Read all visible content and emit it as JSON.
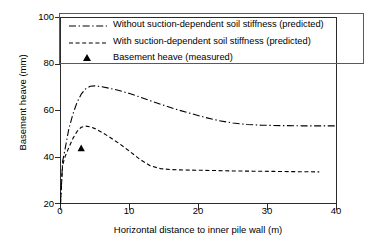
{
  "chart_data": {
    "type": "line",
    "title": "",
    "xlabel": "Horizontal distance to inner pile wall (m)",
    "ylabel": "Basement heave (mm)",
    "xlim": [
      0,
      40
    ],
    "ylim": [
      20,
      100
    ],
    "xticks": [
      0,
      10,
      20,
      30,
      40
    ],
    "yticks": [
      20,
      40,
      60,
      80,
      100
    ],
    "grid": false,
    "legend_position": "top-left",
    "series": [
      {
        "name": "Without suction-dependent soil stiffness (predicted)",
        "style": "dash-dot",
        "color": "#000000",
        "x": [
          0.0,
          0.3,
          0.7,
          1.2,
          1.8,
          2.4,
          3.0,
          3.6,
          4.3,
          5.0,
          6.0,
          7.0,
          8.5,
          10.0,
          11.5,
          13.0,
          15.0,
          17.0,
          19.0,
          21.0,
          23.0,
          25.0,
          27.0,
          29.0,
          32.0,
          35.0,
          38.0,
          40.0
        ],
        "y": [
          20.0,
          38.0,
          44.0,
          52.0,
          58.5,
          63.5,
          67.0,
          69.2,
          70.4,
          70.6,
          70.2,
          69.6,
          68.6,
          67.3,
          65.8,
          64.2,
          62.2,
          60.3,
          58.6,
          57.0,
          55.6,
          54.6,
          54.0,
          53.7,
          53.5,
          53.4,
          53.4,
          53.4
        ]
      },
      {
        "name": "With suction-dependent soil stiffness (predicted)",
        "style": "dashed",
        "color": "#000000",
        "x": [
          0.0,
          0.3,
          0.7,
          1.2,
          1.8,
          2.4,
          3.0,
          3.6,
          4.3,
          5.0,
          6.0,
          7.0,
          8.5,
          10.0,
          11.5,
          13.0,
          14.5,
          16.0,
          18.0,
          20.0,
          22.0,
          25.0,
          28.0,
          31.0,
          34.0,
          37.5
        ],
        "y": [
          20.0,
          36.5,
          40.5,
          44.0,
          48.0,
          51.0,
          52.8,
          53.3,
          53.0,
          52.2,
          50.6,
          48.8,
          45.8,
          42.5,
          39.0,
          36.2,
          35.0,
          34.6,
          34.4,
          34.3,
          34.2,
          34.0,
          33.9,
          33.8,
          33.7,
          33.6
        ]
      },
      {
        "name": "Basement heave (measured)",
        "style": "marker-triangle",
        "color": "#000000",
        "x": [
          3.0
        ],
        "y": [
          43.8
        ]
      }
    ]
  },
  "legend": {
    "items": [
      {
        "label": "Without suction-dependent soil stiffness (predicted)",
        "key": "dash-dot-line"
      },
      {
        "label": "With suction-dependent soil stiffness (predicted)",
        "key": "dashed-line"
      },
      {
        "label": "Basement heave (measured)",
        "key": "triangle-marker"
      }
    ]
  },
  "axes": {
    "x_label": "Horizontal distance to inner pile wall (m)",
    "y_label": "Basement heave (mm)",
    "x_tick_labels": [
      "0",
      "10",
      "20",
      "30",
      "40"
    ],
    "y_tick_labels": [
      "100",
      "80",
      "60",
      "40",
      "20"
    ]
  }
}
